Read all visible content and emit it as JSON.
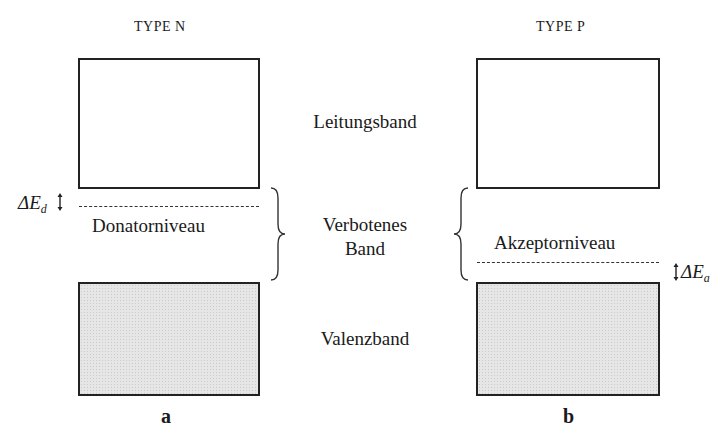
{
  "diagram": {
    "type_n": {
      "title": "TYPE  N",
      "level_label": "Donatorniveau",
      "delta_symbol": "ΔE",
      "delta_sub": "d",
      "caption": "a"
    },
    "type_p": {
      "title": "TYPE  P",
      "level_label": "Akzeptorniveau",
      "delta_symbol": "ΔE",
      "delta_sub": "a",
      "caption": "b"
    },
    "bands": {
      "conduction": "Leitungsband",
      "forbidden_line1": "Verbotenes",
      "forbidden_line2": "Band",
      "valence": "Valenzband"
    },
    "colors": {
      "stroke": "#222222",
      "valence_fill": "#e6e6e6"
    }
  }
}
